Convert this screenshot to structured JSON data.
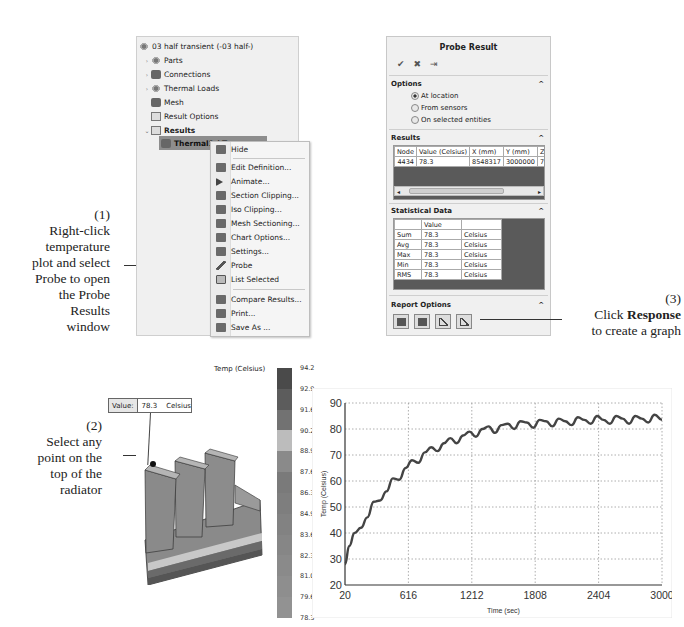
{
  "annotations": {
    "step1": {
      "number": "(1)",
      "text": [
        "Right-click",
        "temperature",
        "plot and select",
        "Probe to open",
        "the Probe",
        "Results",
        "window"
      ]
    },
    "step2": {
      "number": "(2)",
      "text": [
        "Select any",
        "point on the",
        "top of the",
        "radiator"
      ]
    },
    "step3": {
      "number": "(3)",
      "line1_prefix": "Click ",
      "line1_bold": "Response",
      "line2": "to create a graph"
    }
  },
  "tree": {
    "root": "03 half transient (-03 half-)",
    "items": [
      {
        "label": "Parts",
        "expander": "›"
      },
      {
        "label": "Connections",
        "expander": "›"
      },
      {
        "label": "Thermal Loads",
        "expander": "›"
      },
      {
        "label": "Mesh",
        "expander": ""
      },
      {
        "label": "Result Options",
        "expander": ""
      },
      {
        "label": "Results",
        "expander": "⌄"
      },
      {
        "label": "Thermal1 (-T",
        "expander": ""
      }
    ]
  },
  "context_menu": {
    "items": [
      {
        "label": "Hide",
        "icon": "hide-icon"
      },
      {
        "label": "Edit Definition...",
        "icon": "edit-definition-icon"
      },
      {
        "label": "Animate...",
        "icon": "animate-icon"
      },
      {
        "label": "Section Clipping...",
        "icon": "section-clipping-icon"
      },
      {
        "label": "Iso Clipping...",
        "icon": "iso-clipping-icon"
      },
      {
        "label": "Mesh Sectioning...",
        "icon": "mesh-sectioning-icon"
      },
      {
        "label": "Chart Options...",
        "icon": "chart-options-icon"
      },
      {
        "label": "Settings...",
        "icon": "settings-icon"
      },
      {
        "label": "Probe",
        "icon": "probe-icon"
      },
      {
        "label": "List Selected",
        "icon": "list-selected-icon"
      },
      {
        "label": "Compare Results...",
        "icon": "compare-results-icon"
      },
      {
        "label": "Print...",
        "icon": "print-icon"
      },
      {
        "label": "Save As ...",
        "icon": "save-as-icon"
      }
    ]
  },
  "probe_result": {
    "title": "Probe Result",
    "actions": [
      "✔",
      "✖",
      "⇥"
    ],
    "options": {
      "header": "Options",
      "radios": [
        {
          "label": "At location",
          "checked": true
        },
        {
          "label": "From sensors",
          "checked": false
        },
        {
          "label": "On selected entities",
          "checked": false
        }
      ]
    },
    "results": {
      "header": "Results",
      "columns": [
        "Node",
        "Value (Celsius)",
        "X (mm)",
        "Y (mm)",
        "Z (mm"
      ],
      "rows": [
        [
          "4434",
          "78.3",
          "8548317",
          "3000000",
          "722332"
        ]
      ]
    },
    "statistical": {
      "header": "Statistical Data",
      "columns": [
        "",
        "Value",
        ""
      ],
      "rows": [
        [
          "Sum",
          "78.3",
          "Celsius"
        ],
        [
          "Avg",
          "78.3",
          "Celsius"
        ],
        [
          "Max",
          "78.3",
          "Celsius"
        ],
        [
          "Min",
          "78.3",
          "Celsius"
        ],
        [
          "RMS",
          "78.3",
          "Celsius"
        ]
      ]
    },
    "report": {
      "header": "Report Options",
      "buttons": [
        "save-as-sensor",
        "save-file",
        "plot",
        "response"
      ]
    }
  },
  "value_box": {
    "label": "Value:",
    "value": "78.3",
    "unit": "Celsius"
  },
  "legend": {
    "title": "Temp (Celsius)",
    "ticks": [
      "94.2",
      "92.9",
      "91.6",
      "90.2",
      "88.9",
      "87.6",
      "86.3",
      "84.9",
      "83.6",
      "82.3",
      "81.0",
      "79.6",
      "78.3"
    ],
    "colors": [
      "#4a4a4a",
      "#5c5c5c",
      "#727272",
      "#bcbcbc",
      "#8a8a8a",
      "#7a7a7a",
      "#7e7e7e",
      "#828282",
      "#868686",
      "#8a8a8a",
      "#8e8e8e",
      "#929292",
      "#9a9a9a"
    ]
  },
  "chart_data": {
    "type": "line",
    "title": "",
    "xlabel": "Time (sec)",
    "ylabel": "Temp (Celsius)",
    "xlim": [
      20,
      3000
    ],
    "ylim": [
      20,
      90
    ],
    "x_ticks": [
      "20",
      "616",
      "1212",
      "1808",
      "2404",
      "3000"
    ],
    "y_ticks": [
      "20",
      "30",
      "40",
      "50",
      "60",
      "70",
      "80",
      "90"
    ],
    "grid": true,
    "series": [
      {
        "name": "Probe Node 4434",
        "x": [
          20,
          60,
          110,
          170,
          230,
          290,
          350,
          410,
          470,
          530,
          590,
          650,
          710,
          770,
          830,
          890,
          950,
          1010,
          1070,
          1130,
          1190,
          1250,
          1310,
          1370,
          1430,
          1490,
          1550,
          1610,
          1670,
          1730,
          1790,
          1850,
          1910,
          1970,
          2030,
          2090,
          2150,
          2210,
          2270,
          2330,
          2390,
          2450,
          2510,
          2570,
          2630,
          2690,
          2750,
          2810,
          2870,
          2930,
          3000
        ],
        "y": [
          28,
          35,
          40,
          42,
          46,
          52,
          52.5,
          56,
          61,
          60.5,
          65,
          68,
          67,
          71,
          73,
          71.5,
          74.5,
          76.5,
          74.5,
          77.5,
          79,
          77,
          80,
          81,
          78.5,
          81.5,
          82,
          80,
          83,
          82.5,
          80.5,
          83.5,
          83,
          81,
          84,
          83,
          81.5,
          84.5,
          83.5,
          82,
          85,
          83.5,
          82,
          85,
          84,
          82,
          85,
          84,
          82.5,
          85.5,
          83.5
        ]
      }
    ]
  }
}
